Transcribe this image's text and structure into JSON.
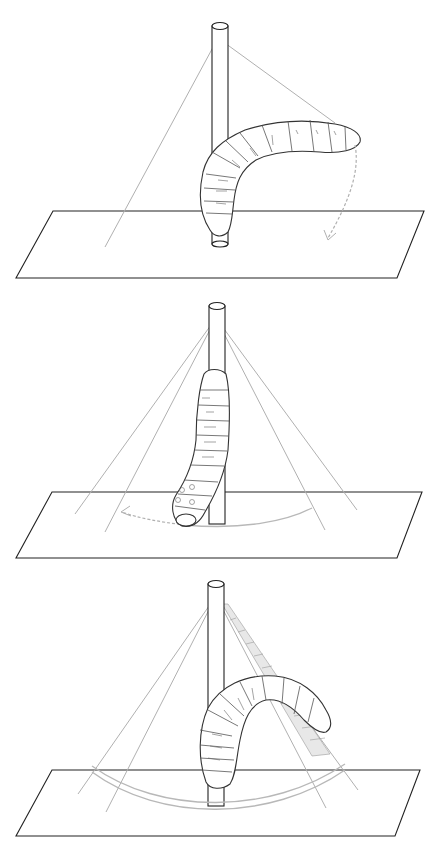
{
  "figure": {
    "colors": {
      "background": "#ffffff",
      "outline": "#222222",
      "rays": "#b0b0b0",
      "hatch": "#9a9a9a"
    },
    "panels": [
      {
        "id": "panel-1",
        "caption": "",
        "pose": "body bent horizontally away from rod, head at right",
        "motion_arrow": "dashed arc curving downward to the right",
        "ray_count": 2
      },
      {
        "id": "panel-2",
        "caption": "",
        "pose": "body hanging vertically along rod, head at bottom left",
        "motion_arrow": "dashed arc pointing left along plate",
        "ray_count": 4
      },
      {
        "id": "panel-3",
        "caption": "",
        "pose": "body arched over, head at right, shaded ray band crossing body",
        "motion_arrow": "double arc across plate",
        "ray_count": 4
      }
    ]
  }
}
